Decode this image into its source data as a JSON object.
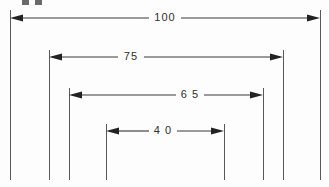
{
  "drawing": {
    "title": "Nested horizontal dimension drawing",
    "units": "mm",
    "background_color": "#fdfdfd",
    "line_color": "#3a3a3a",
    "extension_line_color": "#585858",
    "text_color": "#2e2e2e",
    "arrow_color": "#222222",
    "width": 329,
    "height": 187,
    "extension_lines_bottom_y": 180,
    "partial_crop_mark": {
      "label": "cropped-text-remnant",
      "x": 22,
      "y": 0,
      "width": 20,
      "height": 5
    },
    "dimensions": [
      {
        "id": "dim-100",
        "label": "100",
        "value": 100,
        "left_x": 10,
        "right_x": 320,
        "line_y": 18,
        "text_x": 165,
        "text_y": 18,
        "text_gap_half": 16,
        "ext_top_y": 10
      },
      {
        "id": "dim-75",
        "label": "75",
        "value": 75,
        "left_x": 49,
        "right_x": 283,
        "line_y": 57,
        "text_x": 131,
        "text_y": 57,
        "text_gap_half": 13,
        "ext_top_y": 50
      },
      {
        "id": "dim-65",
        "label": "6 5",
        "value": 65,
        "left_x": 69,
        "right_x": 263,
        "line_y": 95,
        "text_x": 190,
        "text_y": 95,
        "text_gap_half": 14,
        "ext_top_y": 88
      },
      {
        "id": "dim-40",
        "label": "4 0",
        "value": 40,
        "left_x": 106,
        "right_x": 224,
        "line_y": 131,
        "text_x": 163,
        "text_y": 131,
        "text_gap_half": 14,
        "ext_top_y": 124
      }
    ],
    "extension_lines": [
      {
        "id": "ext-left-100",
        "x": 10,
        "top_y": 10,
        "bottom_y": 180
      },
      {
        "id": "ext-left-75",
        "x": 49,
        "top_y": 50,
        "bottom_y": 180
      },
      {
        "id": "ext-left-65",
        "x": 69,
        "top_y": 88,
        "bottom_y": 180
      },
      {
        "id": "ext-left-40",
        "x": 106,
        "top_y": 124,
        "bottom_y": 180
      },
      {
        "id": "ext-right-40",
        "x": 224,
        "top_y": 124,
        "bottom_y": 180
      },
      {
        "id": "ext-right-65",
        "x": 263,
        "top_y": 88,
        "bottom_y": 180
      },
      {
        "id": "ext-right-75",
        "x": 283,
        "top_y": 50,
        "bottom_y": 180
      },
      {
        "id": "ext-right-100",
        "x": 320,
        "top_y": 10,
        "bottom_y": 180
      }
    ]
  }
}
